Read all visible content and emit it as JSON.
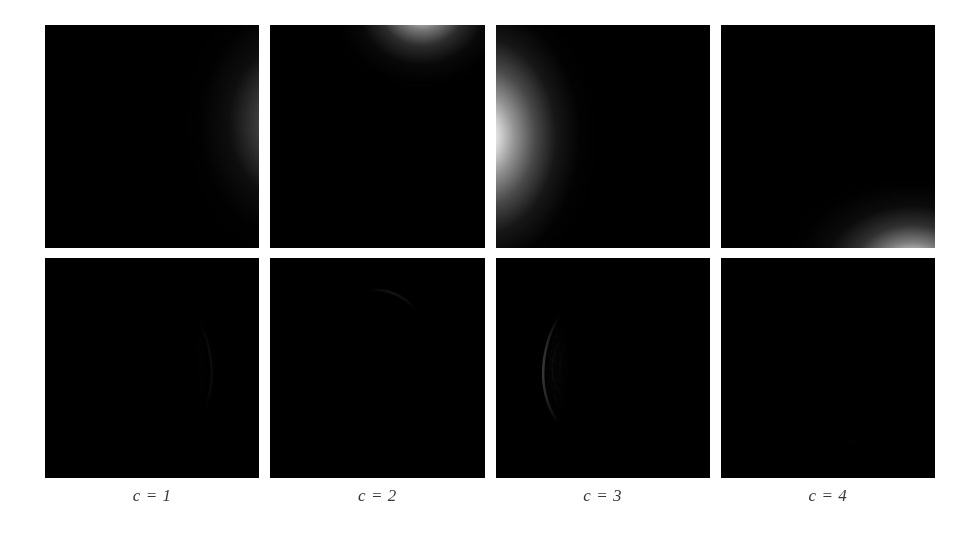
{
  "figure": {
    "type": "image-grid",
    "rows": 2,
    "columns": 4,
    "background_color": "#ffffff",
    "panel_background": "#000000"
  },
  "columns": [
    {
      "caption": "c = 1",
      "sensitivity": {
        "name": "coil-sensitivity-map-1",
        "hotspot": "right-edge",
        "peak_position_percent": [
          112,
          44
        ],
        "peak_brightness": 0.58
      },
      "coil_image": {
        "name": "coil-image-1",
        "visible_anatomy": "right lateral margin, very faint"
      }
    },
    {
      "caption": "c = 2",
      "sensitivity": {
        "name": "coil-sensitivity-map-2",
        "hotspot": "top-center-right",
        "peak_position_percent": [
          70,
          -6
        ],
        "peak_brightness": 1.0
      },
      "coil_image": {
        "name": "coil-image-2",
        "visible_anatomy": "superior skull arc and upper cortex"
      }
    },
    {
      "caption": "c = 3",
      "sensitivity": {
        "name": "coil-sensitivity-map-3",
        "hotspot": "left-edge",
        "peak_position_percent": [
          -4,
          50
        ],
        "peak_brightness": 1.0
      },
      "coil_image": {
        "name": "coil-image-3",
        "visible_anatomy": "left lateral cortex with lateral ventricles"
      }
    },
    {
      "caption": "c = 4",
      "sensitivity": {
        "name": "coil-sensitivity-map-4",
        "hotspot": "bottom-right-corner",
        "peak_position_percent": [
          88,
          106
        ],
        "peak_brightness": 1.0
      },
      "coil_image": {
        "name": "coil-image-4",
        "visible_anatomy": "inferior skull arc and skull base"
      }
    }
  ]
}
